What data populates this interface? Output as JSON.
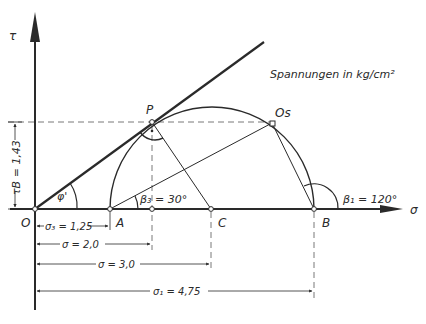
{
  "diagram": {
    "title": "Spannungen in kg/cm²",
    "axes": {
      "y_label": "τ",
      "x_label": "σ"
    },
    "points": {
      "origin": "O",
      "A": "A",
      "B": "B",
      "C": "C",
      "P": "P",
      "Os": "Os"
    },
    "angles": {
      "phi": "φ'",
      "beta3": "β₃ = 30°",
      "beta1": "β₁ = 120°"
    },
    "dimensions": {
      "tau_B": "τB = 1,43",
      "sigma3": "σ₃ = 1,25",
      "sigma_2": "σ = 2,0",
      "sigma_3": "σ = 3,0",
      "sigma1": "σ₁ = 4,75"
    },
    "colors": {
      "ink": "#2a2a2a",
      "background": "#ffffff"
    }
  }
}
